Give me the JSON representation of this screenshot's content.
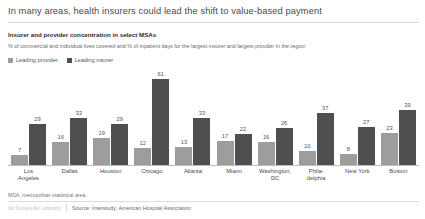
{
  "header": {
    "title": "In many areas, health insurers could lead the shift to value-based payment",
    "subtitle": "Insurer and provider concentration in select MSAs",
    "description": "% of commercial and individual lives covered and % of inpatient days for the largest insurer and largest provider in the region"
  },
  "legend": {
    "provider_label": "Leading provider",
    "insurer_label": "Leading insurer",
    "provider_color": "#9d9d9d",
    "insurer_color": "#4f4f4f"
  },
  "footer": {
    "footnote": "MSA, metropolitan statistical area.",
    "brand": "McKinsey&Company",
    "source": "Source: Interstudy; American Hospital Association"
  },
  "chart_data": {
    "type": "bar",
    "title": "Insurer and provider concentration in select MSAs",
    "subtitle": "% of commercial and individual lives covered and % of inpatient days for the largest insurer and largest provider in the region",
    "xlabel": "",
    "ylabel": "",
    "ylim": [
      0,
      61
    ],
    "grid": false,
    "legend_position": "top-left",
    "categories": [
      "Los Angeles",
      "Dallas",
      "Houston",
      "Chicago",
      "Atlanta",
      "Miami",
      "Washington, DC",
      "Phila-delphia",
      "New York",
      "Boston"
    ],
    "category_lines": [
      [
        "Los",
        "Angeles"
      ],
      [
        "Dallas"
      ],
      [
        "Houston"
      ],
      [
        "Chicago"
      ],
      [
        "Atlanta"
      ],
      [
        "Miami"
      ],
      [
        "Washington,",
        "DC"
      ],
      [
        "Phila-",
        "delphia"
      ],
      [
        "New York"
      ],
      [
        "Boston"
      ]
    ],
    "series": [
      {
        "name": "Leading provider",
        "color": "#9d9d9d",
        "values": [
          7,
          16,
          19,
          12,
          13,
          17,
          16,
          10,
          8,
          23
        ]
      },
      {
        "name": "Leading insurer",
        "color": "#4f4f4f",
        "values": [
          29,
          33,
          29,
          61,
          33,
          22,
          26,
          37,
          27,
          39
        ]
      }
    ]
  }
}
